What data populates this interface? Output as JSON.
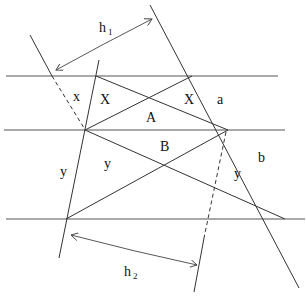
{
  "labels": {
    "h1": "h",
    "h1_sub": "1",
    "h2": "h",
    "h2_sub": "2",
    "x_small": "x",
    "X_left": "X",
    "X_right": "X",
    "A": "A",
    "B": "B",
    "a": "a",
    "b": "b",
    "y_outer": "y",
    "y_inner": "y",
    "y_right": "y"
  },
  "colors": {
    "line": "#333333",
    "background": "#ffffff"
  }
}
